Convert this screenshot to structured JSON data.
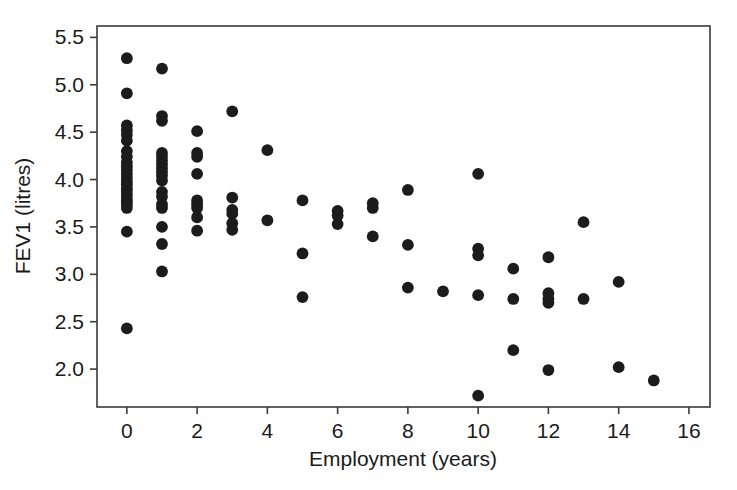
{
  "chart_data": {
    "type": "scatter",
    "title": "",
    "xlabel": "Employment (years)",
    "ylabel": "FEV1 (litres)",
    "xlim": [
      -0.85,
      16.6
    ],
    "ylim": [
      1.6,
      5.62
    ],
    "xticks": [
      0,
      2,
      4,
      6,
      8,
      10,
      12,
      14,
      16
    ],
    "xticklabels": [
      "0",
      "2",
      "4",
      "6",
      "8",
      "10",
      "12",
      "14",
      "16"
    ],
    "yticks": [
      2.0,
      2.5,
      3.0,
      3.5,
      4.0,
      4.5,
      5.0,
      5.5
    ],
    "yticklabels": [
      "2.0",
      "2.5",
      "3.0",
      "3.5",
      "4.0",
      "4.5",
      "5.0",
      "5.5"
    ],
    "grid": false,
    "legend": null,
    "marker": "filled-circle",
    "marker_color": "#1c1c1c",
    "marker_size": 7,
    "n_points": 84,
    "x": [
      0,
      0,
      0,
      0,
      0,
      0,
      0,
      0,
      0,
      0,
      0,
      0,
      0,
      0,
      0,
      0,
      0,
      0,
      0,
      0,
      0,
      0,
      0,
      0,
      1,
      1,
      1,
      1,
      1,
      1,
      1,
      1,
      1,
      1,
      1,
      1,
      1,
      1,
      1,
      1,
      1,
      1,
      2,
      2,
      2,
      2,
      2,
      2,
      2,
      2,
      2,
      3,
      3,
      3,
      3,
      3,
      3,
      4,
      4,
      5,
      5,
      5,
      6,
      6,
      6,
      7,
      7,
      7,
      8,
      8,
      8,
      9,
      10,
      10,
      10,
      10,
      10,
      11,
      11,
      11,
      12,
      12,
      12,
      12,
      12,
      13,
      13,
      14,
      14,
      15
    ],
    "y": [
      5.28,
      4.91,
      4.57,
      4.52,
      4.47,
      4.41,
      4.3,
      4.18,
      4.14,
      4.1,
      4.06,
      4.02,
      3.98,
      3.95,
      3.91,
      3.88,
      3.84,
      3.8,
      3.77,
      3.74,
      3.7,
      3.45,
      2.43,
      4.24,
      5.17,
      4.67,
      4.62,
      4.28,
      4.24,
      4.2,
      4.16,
      4.12,
      4.08,
      4.04,
      3.99,
      3.87,
      3.82,
      3.74,
      3.7,
      3.5,
      3.32,
      3.03,
      4.51,
      4.28,
      4.24,
      4.06,
      3.78,
      3.74,
      3.7,
      3.6,
      3.46,
      4.72,
      3.81,
      3.68,
      3.64,
      3.54,
      3.47,
      4.31,
      3.57,
      3.78,
      3.22,
      2.76,
      3.67,
      3.62,
      3.53,
      3.75,
      3.7,
      3.4,
      3.89,
      3.31,
      2.86,
      2.82,
      4.06,
      3.27,
      3.2,
      2.78,
      1.72,
      3.06,
      2.74,
      2.2,
      3.18,
      2.8,
      2.74,
      2.7,
      1.99,
      3.55,
      2.74,
      2.92,
      2.02,
      1.88
    ]
  },
  "axes": {
    "x_axis_label": "Employment (years)",
    "y_axis_label": "FEV1 (litres)"
  }
}
